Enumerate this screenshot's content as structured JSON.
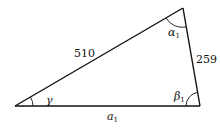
{
  "diagram": {
    "type": "triangle",
    "vertices": {
      "left": {
        "x": 15,
        "y": 106
      },
      "top": {
        "x": 183,
        "y": 8
      },
      "right": {
        "x": 200,
        "y": 106
      }
    },
    "sides": {
      "hypotenuse_label": "510",
      "right_side_label": "259",
      "base_label_main": "a",
      "base_label_sub": "1"
    },
    "angles": {
      "left_label": "γ",
      "top_label_main": "α",
      "top_label_sub": "1",
      "right_label_main": "β",
      "right_label_sub": "1"
    },
    "colors": {
      "stroke": "#111111",
      "background": "#ffffff"
    }
  }
}
